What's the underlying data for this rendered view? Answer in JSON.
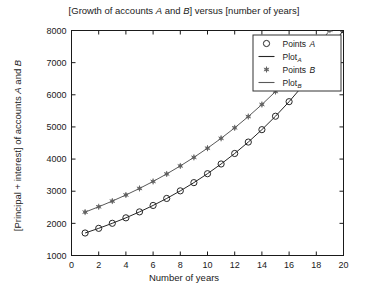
{
  "chart_data": {
    "type": "line",
    "title": "[Growth of accounts A and B] versus [number of years]",
    "xlabel": "Number of years",
    "ylabel": "[Principal + interest] of accounts A and B",
    "xlim": [
      0,
      20
    ],
    "ylim": [
      1000,
      8000
    ],
    "xticks": [
      0,
      2,
      4,
      6,
      8,
      10,
      12,
      14,
      16,
      18,
      20
    ],
    "yticks": [
      1000,
      2000,
      3000,
      4000,
      5000,
      6000,
      7000,
      8000
    ],
    "xtick_labels": [
      "0",
      "2",
      "4",
      "6",
      "8",
      "10",
      "12",
      "14",
      "16",
      "18",
      "20"
    ],
    "ytick_labels": [
      "1000",
      "2000",
      "3000",
      "4000",
      "5000",
      "6000",
      "7000",
      "8000"
    ],
    "grid": false,
    "legend_position": "upper right",
    "x": [
      1,
      2,
      3,
      4,
      5,
      6,
      7,
      8,
      9,
      10,
      11,
      12,
      13,
      14,
      15,
      16,
      17,
      18,
      19,
      20
    ],
    "series": [
      {
        "name": "Points A",
        "marker": "circle",
        "color": "#262626",
        "values": [
          1700,
          1845,
          2002,
          2172,
          2357,
          2557,
          2775,
          3011,
          3267,
          3545,
          3847,
          4174,
          4529,
          4915,
          5333,
          5786,
          6278,
          6812,
          7392,
          8022
        ]
      },
      {
        "name": "Plot A",
        "marker": "line",
        "color": "#262626",
        "values": [
          1700,
          1845,
          2002,
          2172,
          2357,
          2557,
          2775,
          3011,
          3267,
          3545,
          3847,
          4174,
          4529,
          4915,
          5333,
          5786,
          6278,
          6812,
          7392,
          8022
        ]
      },
      {
        "name": "Points B",
        "marker": "hexagram",
        "color": "#595959",
        "values": [
          2350,
          2516,
          2693,
          2883,
          3086,
          3304,
          3537,
          3786,
          4053,
          4339,
          4645,
          4972,
          5323,
          5698,
          6100,
          6530,
          6990,
          7483,
          8011,
          8576
        ]
      },
      {
        "name": "Plot B",
        "marker": "line",
        "color": "#595959",
        "values": [
          2350,
          2516,
          2693,
          2883,
          3086,
          3304,
          3537,
          3786,
          4053,
          4339,
          4645,
          4972,
          5323,
          5698,
          6100,
          6530,
          6990,
          7483,
          8011,
          8576
        ]
      }
    ]
  },
  "title_parts": {
    "pre": "[Growth of accounts ",
    "a": "A",
    "mid": " and ",
    "b": "B",
    "post": "] versus [number of years]"
  },
  "ylabel_parts": {
    "pre": "[Principal + interest] of accounts ",
    "a": "A",
    "mid": " and ",
    "b": "B"
  },
  "xlabel_text": "Number of years",
  "legend": {
    "entries": [
      {
        "label": "Points",
        "italic": "A",
        "kind": "marker",
        "marker": "circle"
      },
      {
        "label": "Plot",
        "italic": "A",
        "kind": "line",
        "marker": "line"
      },
      {
        "label": "Points",
        "italic": "B",
        "kind": "marker",
        "marker": "hexagram"
      },
      {
        "label": "Plot",
        "italic": "B",
        "kind": "line",
        "marker": "line"
      }
    ]
  },
  "colors": {
    "axis": "#1a1a1a",
    "series_a": "#262626",
    "series_b": "#666666",
    "legend_border": "#333333",
    "background": "#ffffff"
  }
}
